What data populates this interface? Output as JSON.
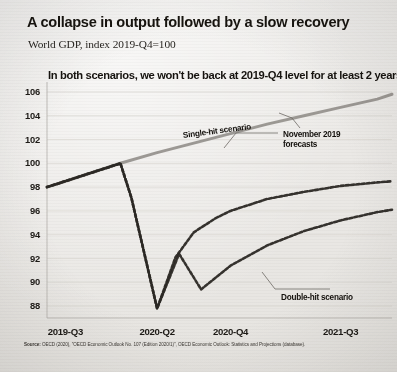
{
  "title": "A collapse in output followed by a slow recovery",
  "subtitle": "World GDP, index 2019-Q4=100",
  "kicker": "In both scenarios, we won't be back at 2019-Q4 level for at least 2 years",
  "source_prefix": "Source:",
  "source": "OECD (2020), \"OECD Economic Outlook No. 107 (Edition 2020/1)\", OECD Economic Outlook: Statistics and Projections (database).",
  "annotations": {
    "single": "Single-hit scenario",
    "november_line1": "November 2019",
    "november_line2": "forecasts",
    "double": "Double-hit scenario"
  },
  "colors": {
    "paper": "#edebe8",
    "ink": "#17140f",
    "forecast_line": "#8d8a85",
    "scenario_line": "#2b2824",
    "grid": "#d8d5d0"
  },
  "chart_data": {
    "type": "line",
    "title": "A collapse in output followed by a slow recovery",
    "subtitle": "World GDP, index 2019-Q4=100",
    "xlabel": "",
    "ylabel": "",
    "ylim": [
      87,
      106.5
    ],
    "yticks": [
      88,
      90,
      92,
      94,
      96,
      98,
      100,
      102,
      104,
      106
    ],
    "xticks": [
      "2019-Q3",
      "2020-Q2",
      "2020-Q4",
      "2021-Q3"
    ],
    "xtick_x": [
      0.5,
      3.0,
      5.0,
      8.0
    ],
    "xlim": [
      0,
      9.4
    ],
    "grid": "horizontal",
    "legend": "annotations",
    "series": [
      {
        "name": "November 2019 forecasts",
        "style": "solid",
        "color": "#8d8a85",
        "x": [
          0.0,
          0.5,
          1.0,
          1.5,
          2.0,
          3.0,
          4.0,
          5.0,
          6.0,
          7.0,
          8.0,
          9.0,
          9.4
        ],
        "values": [
          98.0,
          98.5,
          99.0,
          99.5,
          100.0,
          100.9,
          101.7,
          102.5,
          103.3,
          104.0,
          104.7,
          105.4,
          105.8
        ]
      },
      {
        "name": "Single-hit scenario",
        "style": "dashed",
        "color": "#2b2824",
        "x": [
          0.0,
          0.5,
          1.0,
          1.5,
          2.0,
          2.3,
          3.0,
          3.5,
          4.0,
          4.6,
          5.0,
          6.0,
          7.0,
          8.0,
          9.0,
          9.4
        ],
        "values": [
          98.0,
          98.5,
          99.0,
          99.5,
          100.0,
          97.1,
          87.8,
          92.1,
          94.2,
          95.4,
          96.0,
          97.0,
          97.6,
          98.1,
          98.4,
          98.5
        ]
      },
      {
        "name": "Double-hit scenario",
        "style": "dashed",
        "color": "#2b2824",
        "x": [
          0.0,
          0.5,
          1.0,
          1.5,
          2.0,
          2.3,
          3.0,
          3.6,
          4.2,
          5.0,
          6.0,
          7.0,
          8.0,
          9.0,
          9.4
        ],
        "values": [
          98.0,
          98.5,
          99.0,
          99.5,
          100.0,
          97.1,
          87.8,
          92.4,
          89.4,
          91.4,
          93.1,
          94.3,
          95.2,
          95.9,
          96.1
        ]
      }
    ]
  }
}
